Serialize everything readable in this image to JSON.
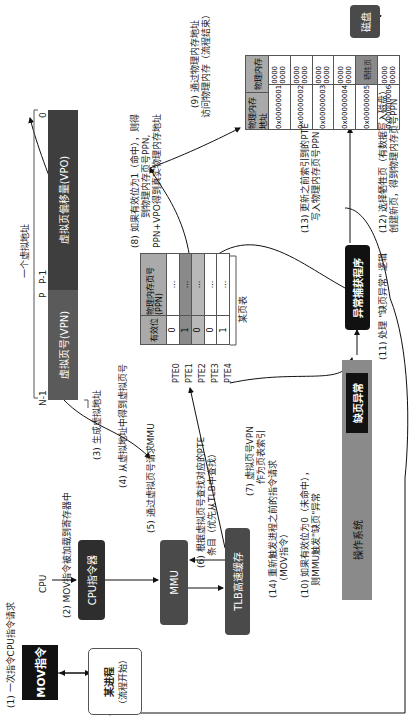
{
  "nodes": {
    "mov_instruction": "MOV指令",
    "process": "某进程",
    "process_sub": "（流程开始）",
    "cpu_label": "CPU",
    "cpu_register": "CPU指令器",
    "mmu": "MMU",
    "tlb": "TLB高速缓存",
    "os": "操作系统",
    "page_fault": "缺页异常",
    "exception_handler": "异常捕获程序",
    "disk": "磁盘"
  },
  "virtual_address": {
    "title": "一个虚拟地址",
    "vpn": "虚拟页号(VPN)",
    "vpo": "虚拟页偏移量(VPO)",
    "bit_high": "N-1",
    "bit_p": "P",
    "bit_p1": "P-1",
    "bit_zero": "0"
  },
  "page_table": {
    "caption": "某页表",
    "headers": [
      "有效位",
      "物理内存页号(PPN)"
    ],
    "rows": [
      {
        "label": "PTE0",
        "valid": "0",
        "ppn": "..."
      },
      {
        "label": "PTE1",
        "valid": "1",
        "ppn": "..."
      },
      {
        "label": "PTE2",
        "valid": "0",
        "ppn": "..."
      },
      {
        "label": "PTE3",
        "valid": "0",
        "ppn": "..."
      },
      {
        "label": "PTE4",
        "valid": "1",
        "ppn": "..."
      }
    ]
  },
  "physical_memory": {
    "headers": [
      "物理内存地址",
      "物理内存"
    ],
    "rows": [
      {
        "addr": "0x00000001",
        "value": "0000 0000"
      },
      {
        "addr": "0x00000002",
        "value": "0000 0000"
      },
      {
        "addr": "0x00000003",
        "value": "0000 0000"
      },
      {
        "addr": "0x00000004",
        "value": "0000 0000"
      },
      {
        "addr": "0x00000005",
        "value": "牺牲页"
      },
      {
        "addr": "0x00000006",
        "value": "0000 0000"
      }
    ]
  },
  "steps": {
    "s1": "(1) 一次指令CPU指令请求",
    "s2": "(2) MOV指令被加载到寄存器中",
    "s3": "(3) 生成虚拟地址",
    "s4": "(4) 从虚拟地址中得到虚拟页号",
    "s5": "(5) 通过虚拟页号请求MMU",
    "s6a": "(6) 根据虚拟页号查找对应的PTE",
    "s6b": "条目（优先从TLB中查找）",
    "s7a": "(7) 虚拟页号VPN",
    "s7b": "作为页表索引",
    "s8a": "(8) 如果有效位为1（命中），则得",
    "s8b": "到物理内存页号PPN,",
    "s8c": "PPN+VPO得到真实物理内存地址",
    "s9a": "(9) 通过物理内存地址",
    "s9b": "访问物理内存（流程结束）",
    "s10a": "(10) 如果有效位为0（未命中），",
    "s10b": "则MMU触发\"缺页\"异常",
    "s11": "(11) 处理 \"缺页异常\" 逻辑",
    "s12a": "(12) 选择牺牲页（有数据写入磁盘）",
    "s12b": "创建新页，得到物理内存页号PPN",
    "s13a": "(13) 更新之前索引到的PTE",
    "s13b": "写入物理内存页号PPN",
    "s14a": "(14) 重新触发进程之前的指令请求",
    "s14b": "（MOV指令）"
  }
}
